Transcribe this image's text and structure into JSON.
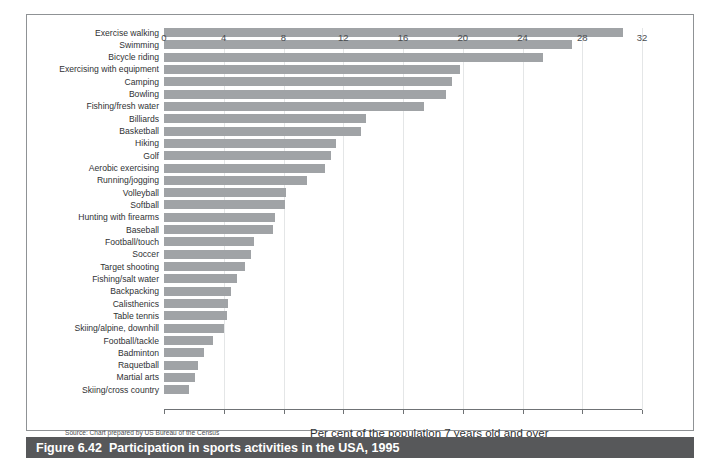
{
  "figure": {
    "caption_number": "Figure 6.42",
    "caption_text": "Participation in sports activities in the USA, 1995",
    "source_note": "Source: Chart prepared by US Bureau of the Census",
    "caption_bar_color": "#57585a",
    "bar_color": "#a0a3a6",
    "frame_color": "#8f9295"
  },
  "chart_data": {
    "type": "bar",
    "orientation": "horizontal",
    "title": "Participation in sports activities in the USA, 1995",
    "xlabel": "Per cent of the population 7 years old and over",
    "ylabel": "",
    "xlim": [
      0,
      32
    ],
    "xticks": [
      0,
      4,
      8,
      12,
      16,
      20,
      24,
      28,
      32
    ],
    "xtick_labels": [
      "0",
      "4",
      "8",
      "12",
      "16",
      "20",
      "24",
      "28",
      "32"
    ],
    "grid": true,
    "legend": false,
    "categories": [
      "Exercise walking",
      "Swimming",
      "Bicycle riding",
      "Exercising with equipment",
      "Camping",
      "Bowling",
      "Fishing/fresh water",
      "Billiards",
      "Basketball",
      "Hiking",
      "Golf",
      "Aerobic exercising",
      "Running/jogging",
      "Volleyball",
      "Softball",
      "Hunting with firearms",
      "Baseball",
      "Football/touch",
      "Soccer",
      "Target shooting",
      "Fishing/salt water",
      "Backpacking",
      "Calisthenics",
      "Table tennis",
      "Skiing/alpine, downhill",
      "Football/tackle",
      "Badminton",
      "Raquetball",
      "Martial arts",
      "Skiing/cross country"
    ],
    "values": [
      30.7,
      27.3,
      25.4,
      19.8,
      19.3,
      18.9,
      17.4,
      13.5,
      13.2,
      11.5,
      11.2,
      10.8,
      9.6,
      8.2,
      8.1,
      7.4,
      7.3,
      6.0,
      5.8,
      5.4,
      4.9,
      4.5,
      4.3,
      4.2,
      4.0,
      3.3,
      2.7,
      2.3,
      2.1,
      1.7
    ],
    "unit": "per cent"
  }
}
